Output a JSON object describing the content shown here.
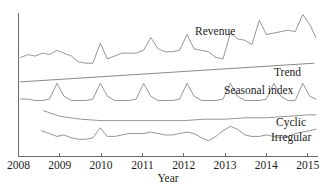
{
  "chart_data": {
    "type": "line",
    "title": "",
    "subtitle": "",
    "xlabel": "Year",
    "ylabel": "",
    "grid": false,
    "legend_position": "inline-right-of-series",
    "xlim": [
      2008,
      2015.25
    ],
    "ylim": [
      0,
      100
    ],
    "x_tick_labels": [
      "2008",
      "2009",
      "2010",
      "2011",
      "2012",
      "2013",
      "2014",
      "2015"
    ],
    "x_ticks": [
      2008,
      2009,
      2010,
      2011,
      2012,
      2013,
      2014,
      2015
    ],
    "y_tick_labels": [],
    "annotations": [
      {
        "text": "Revenue",
        "x": 2013.2,
        "y": 88
      },
      {
        "text": "Trend",
        "x": 2014.95,
        "y": 61
      },
      {
        "text": "Seasonal index",
        "x": 2013.25,
        "y": 50
      },
      {
        "text": "Cyclic",
        "x": 2014.85,
        "y": 28
      },
      {
        "text": "Irregular",
        "x": 2014.8,
        "y": 18
      }
    ],
    "series": [
      {
        "name": "Revenue",
        "color": "#8a8a8a",
        "x": [
          2008.05,
          2008.23,
          2008.4,
          2008.58,
          2008.75,
          2008.93,
          2009.1,
          2009.28,
          2009.45,
          2009.63,
          2009.8,
          2009.98,
          2010.15,
          2010.33,
          2010.5,
          2010.68,
          2010.85,
          2011.03,
          2011.2,
          2011.38,
          2011.55,
          2011.73,
          2011.9,
          2012.08,
          2012.25,
          2012.43,
          2012.6,
          2012.78,
          2012.95,
          2013.13,
          2013.3,
          2013.48,
          2013.65,
          2013.83,
          2014.0,
          2014.18,
          2014.35,
          2014.53,
          2014.7,
          2014.88,
          2015.05,
          2015.2
        ],
        "values": [
          69,
          71,
          70,
          72,
          71,
          74,
          72,
          70,
          66,
          65,
          65,
          79,
          68,
          70,
          72,
          72,
          72,
          74,
          83,
          75,
          73,
          73,
          74,
          85,
          75,
          74,
          73,
          69,
          68,
          86,
          82,
          81,
          78,
          95,
          85,
          86,
          87,
          88,
          87,
          99,
          92,
          83
        ]
      },
      {
        "name": "Trend",
        "color": "#8a8a8a",
        "x": [
          2008.05,
          2015.15
        ],
        "values": [
          52,
          65
        ]
      },
      {
        "name": "Seasonal index",
        "color": "#8a8a8a",
        "x": [
          2008.05,
          2008.23,
          2008.4,
          2008.58,
          2008.75,
          2008.93,
          2009.1,
          2009.28,
          2009.45,
          2009.63,
          2009.8,
          2009.98,
          2010.15,
          2010.33,
          2010.5,
          2010.68,
          2010.85,
          2011.03,
          2011.2,
          2011.38,
          2011.55,
          2011.73,
          2011.9,
          2012.08,
          2012.25,
          2012.43,
          2012.6,
          2012.78,
          2012.95,
          2013.13,
          2013.3,
          2013.48,
          2013.65,
          2013.83,
          2014.0,
          2014.18,
          2014.35,
          2014.53,
          2014.7,
          2014.88,
          2015.05,
          2015.2
        ],
        "values": [
          40,
          40,
          39,
          39,
          40,
          51,
          42,
          39,
          39,
          39,
          40,
          51,
          42,
          39,
          39,
          39,
          40,
          51,
          42,
          39,
          39,
          39,
          40,
          51,
          42,
          39,
          39,
          39,
          40,
          51,
          42,
          39,
          39,
          39,
          40,
          51,
          42,
          39,
          39,
          51,
          42,
          40
        ]
      },
      {
        "name": "Cyclic",
        "color": "#8a8a8a",
        "x": [
          2008.6,
          2009.0,
          2009.5,
          2010.0,
          2010.5,
          2011.0,
          2011.5,
          2012.0,
          2012.5,
          2013.0,
          2013.5,
          2014.0,
          2014.5,
          2015.0,
          2015.2
        ],
        "values": [
          32,
          28,
          26,
          25,
          25,
          25,
          25,
          25,
          26,
          26,
          27,
          27,
          28,
          29,
          29
        ]
      },
      {
        "name": "Irregular",
        "color": "#8a8a8a",
        "x": [
          2008.55,
          2008.75,
          2008.93,
          2009.1,
          2009.28,
          2009.45,
          2009.63,
          2009.8,
          2009.98,
          2010.15,
          2010.33,
          2010.5,
          2010.68,
          2010.85,
          2011.03,
          2011.2,
          2011.38,
          2011.55,
          2011.73,
          2011.9,
          2012.08,
          2012.25,
          2012.43,
          2012.6,
          2012.78,
          2012.95,
          2013.13,
          2013.3,
          2013.48,
          2013.65,
          2013.83,
          2014.0,
          2014.18,
          2014.35,
          2014.53,
          2014.7,
          2014.88,
          2015.05,
          2015.2
        ],
        "values": [
          18,
          16,
          14,
          15,
          13,
          12,
          12,
          13,
          20,
          14,
          14,
          15,
          16,
          16,
          16,
          17,
          16,
          15,
          15,
          16,
          17,
          16,
          13,
          11,
          14,
          18,
          21,
          19,
          15,
          14,
          14,
          15,
          14,
          13,
          14,
          16,
          17,
          18,
          19
        ]
      }
    ]
  },
  "axis": {
    "x_title": "Year",
    "tick_labels": [
      "2008",
      "2009",
      "2010",
      "2011",
      "2012",
      "2013",
      "2014",
      "2015"
    ]
  },
  "labels": {
    "revenue": "Revenue",
    "trend": "Trend",
    "seasonal_index": "Seasonal index",
    "cyclic": "Cyclic",
    "irregular": "Irregular"
  },
  "colors": {
    "line": "#8a8a8a",
    "axis": "#6b6b6b",
    "text": "#1c1c1c",
    "background": "#ffffff"
  }
}
